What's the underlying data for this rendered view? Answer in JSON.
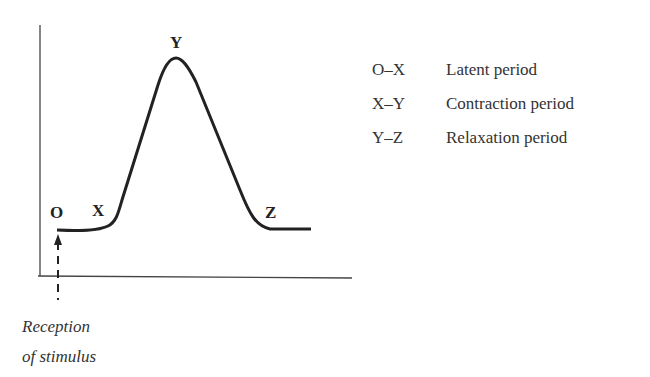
{
  "diagram": {
    "points": {
      "O": "O",
      "X": "X",
      "Y": "Y",
      "Z": "Z"
    },
    "legend": [
      {
        "key": "O–X",
        "label": "Latent period"
      },
      {
        "key": "X–Y",
        "label": "Contraction period"
      },
      {
        "key": "Y–Z",
        "label": "Relaxation period"
      }
    ],
    "caption_line1": "Reception",
    "caption_line2": "of stimulus",
    "colors": {
      "line": "#222222",
      "background": "#ffffff"
    }
  }
}
